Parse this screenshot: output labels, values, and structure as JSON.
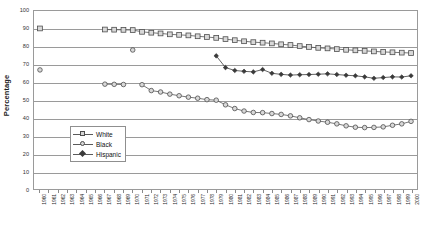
{
  "chart_data": {
    "type": "line",
    "title": "",
    "xlabel": "",
    "ylabel": "Percentage",
    "ylim": [
      0,
      100
    ],
    "ytick_step": 10,
    "yticks": [
      100,
      90,
      80,
      70,
      60,
      50,
      40,
      30,
      20,
      10,
      0
    ],
    "grid": "horizontal",
    "legend_position": "inside-lower-left",
    "x": [
      1960,
      1961,
      1962,
      1963,
      1964,
      1965,
      1966,
      1967,
      1968,
      1969,
      1970,
      1971,
      1972,
      1973,
      1974,
      1975,
      1976,
      1977,
      1978,
      1979,
      1980,
      1981,
      1982,
      1983,
      1984,
      1985,
      1986,
      1987,
      1988,
      1989,
      1990,
      1991,
      1992,
      1993,
      1994,
      1995,
      1996,
      1997,
      1998,
      1999,
      2000
    ],
    "categories": [
      "1960",
      "1961",
      "1962",
      "1963",
      "1964",
      "1965",
      "1966",
      "1967",
      "1968",
      "1969",
      "1970",
      "1971",
      "1972",
      "1973",
      "1974",
      "1975",
      "1976",
      "1977",
      "1978",
      "1979",
      "1980",
      "1981",
      "1982",
      "1983",
      "1984",
      "1985",
      "1986",
      "1987",
      "1988",
      "1989",
      "1990",
      "1991",
      "1992",
      "1993",
      "1994",
      "1995",
      "1996",
      "1997",
      "1998",
      "1999",
      "2000"
    ],
    "series": [
      {
        "name": "White",
        "marker": "square-open",
        "color": "#555555",
        "values": [
          90.2,
          null,
          null,
          null,
          null,
          null,
          null,
          89.6,
          89.5,
          89.4,
          89.3,
          88.3,
          87.8,
          87.4,
          86.9,
          86.6,
          86.3,
          85.8,
          85.4,
          84.9,
          84.2,
          83.6,
          83.0,
          82.5,
          82.2,
          81.8,
          81.3,
          80.9,
          80.3,
          79.8,
          79.3,
          79.0,
          78.6,
          78.2,
          77.9,
          77.6,
          77.3,
          77.0,
          76.8,
          76.6,
          76.4
        ]
      },
      {
        "name": "Black",
        "marker": "circle-open",
        "color": "#555555",
        "values": [
          66.9,
          null,
          null,
          null,
          null,
          null,
          null,
          58.9,
          58.8,
          58.7,
          78.1,
          58.6,
          55.3,
          54.5,
          53.3,
          52.4,
          51.6,
          51.0,
          50.2,
          49.9,
          47.3,
          45.2,
          43.8,
          43.0,
          42.9,
          42.4,
          41.9,
          41.1,
          40.0,
          39.0,
          38.2,
          37.5,
          36.6,
          35.5,
          34.7,
          34.5,
          34.6,
          34.9,
          35.8,
          36.6,
          38.0
        ]
      },
      {
        "name": "Hispanic",
        "marker": "diamond-filled",
        "color": "#3a3a3a",
        "values": [
          null,
          null,
          null,
          null,
          null,
          null,
          null,
          null,
          null,
          null,
          null,
          null,
          null,
          null,
          null,
          null,
          null,
          null,
          null,
          74.8,
          68.2,
          66.6,
          66.1,
          65.8,
          67.1,
          65.0,
          64.4,
          64.0,
          64.2,
          64.3,
          64.5,
          64.7,
          64.3,
          63.9,
          63.6,
          63.0,
          62.2,
          62.6,
          63.0,
          62.9,
          63.6
        ]
      }
    ],
    "legend": [
      {
        "label": "White",
        "marker": "square-open"
      },
      {
        "label": "Black",
        "marker": "circle-open"
      },
      {
        "label": "Hispanic",
        "marker": "diamond-filled"
      }
    ]
  }
}
